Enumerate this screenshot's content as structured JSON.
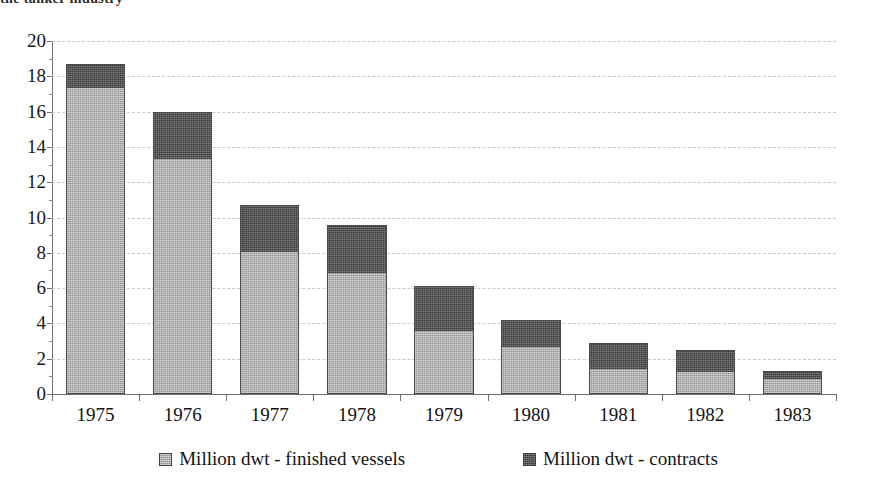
{
  "title": {
    "clipped_text": "the tanker industry"
  },
  "chart_data": {
    "type": "bar",
    "subtype": "stacked-vertical",
    "title": "",
    "xlabel": "",
    "ylabel": "",
    "categories": [
      "1975",
      "1976",
      "1977",
      "1978",
      "1979",
      "1980",
      "1981",
      "1982",
      "1983"
    ],
    "series": [
      {
        "name": "Million dwt - finished vessels",
        "color": "#a8a8a8",
        "values": [
          17.4,
          13.4,
          8.1,
          6.9,
          3.6,
          2.7,
          1.5,
          1.3,
          0.9
        ]
      },
      {
        "name": "Million dwt - contracts",
        "color": "#4d4d4d",
        "values": [
          1.3,
          2.6,
          2.6,
          2.7,
          2.5,
          1.5,
          1.4,
          1.2,
          0.4
        ]
      }
    ],
    "totals": [
      18.7,
      16.0,
      10.7,
      9.6,
      6.1,
      4.2,
      2.9,
      2.5,
      1.3
    ],
    "ylim": [
      0,
      20
    ],
    "ytick_step": 2,
    "ytick_labels": [
      "0",
      "2",
      "4",
      "6",
      "8",
      "10",
      "12",
      "14",
      "16",
      "18",
      "20"
    ],
    "grid": true,
    "grid_style": "dashed",
    "legend_position": "bottom"
  },
  "legend": {
    "entries": [
      {
        "label": "Million dwt - finished vessels",
        "swatch": "finished"
      },
      {
        "label": "Million dwt - contracts",
        "swatch": "contracts"
      }
    ]
  },
  "colors": {
    "finished_vessels": "#a8a8a8",
    "contracts": "#4d4d4d",
    "axis": "#6f6f6f",
    "grid": "#c9c9c9",
    "background": "#ffffff"
  }
}
